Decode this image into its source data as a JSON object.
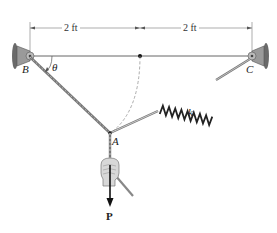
{
  "diagram": {
    "dimensions": [
      {
        "label": "2 ft",
        "from": "B",
        "to": "midpoint"
      },
      {
        "label": "2 ft",
        "from": "midpoint",
        "to": "C"
      }
    ],
    "points": {
      "B": "B",
      "C": "C",
      "A": "A"
    },
    "angle_label": "θ",
    "spring_label": "k",
    "force_label": "P",
    "colors": {
      "line": "#555555",
      "support": "#8a8a8a",
      "wall": "#6a6a6a",
      "arrow": "#111111"
    }
  }
}
